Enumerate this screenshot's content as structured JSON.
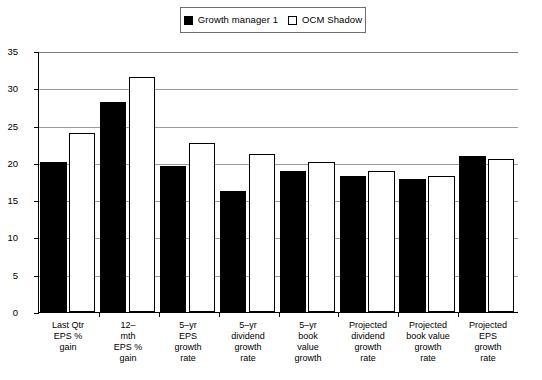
{
  "legend": {
    "entries": [
      {
        "label": "Growth manager 1",
        "style": "filled",
        "color": "#000000"
      },
      {
        "label": "OCM Shadow",
        "style": "open",
        "color": "#ffffff"
      }
    ]
  },
  "axis": {
    "y_ticks": [
      "0",
      "5",
      "10",
      "15",
      "20",
      "25",
      "30",
      "35"
    ]
  },
  "chart_data": {
    "type": "bar",
    "title": "",
    "xlabel": "",
    "ylabel": "",
    "ylim": [
      0,
      35
    ],
    "ytick_step": 5,
    "grid": true,
    "legend_position": "top-center",
    "categories": [
      "Last Qtr EPS % gain",
      "12-mth EPS % gain",
      "5-yr EPS growth rate",
      "5-yr dividend growth rate",
      "5-yr book value growth",
      "Projected dividend growth rate",
      "Projected book value growth rate",
      "Projected EPS growth rate"
    ],
    "category_lines": [
      [
        "Last Qtr",
        "EPS %",
        "gain"
      ],
      [
        "12–",
        "mth",
        "EPS %",
        "gain"
      ],
      [
        "5–yr",
        "EPS",
        "growth",
        "rate"
      ],
      [
        "5–yr",
        "dividend",
        "growth",
        "rate"
      ],
      [
        "5–yr",
        "book",
        "value",
        "growth"
      ],
      [
        "Projected",
        "dividend",
        "growth",
        "rate"
      ],
      [
        "Projected",
        "book value",
        "growth",
        "rate"
      ],
      [
        "Projected",
        "EPS",
        "growth",
        "rate"
      ]
    ],
    "series": [
      {
        "name": "Growth manager 1",
        "color": "#000000",
        "values": [
          20.1,
          28.1,
          19.6,
          16.2,
          18.9,
          18.2,
          17.8,
          20.9
        ]
      },
      {
        "name": "OCM Shadow",
        "color": "#ffffff",
        "values": [
          24.0,
          31.5,
          22.6,
          21.2,
          20.1,
          18.9,
          18.2,
          20.5
        ]
      }
    ]
  }
}
